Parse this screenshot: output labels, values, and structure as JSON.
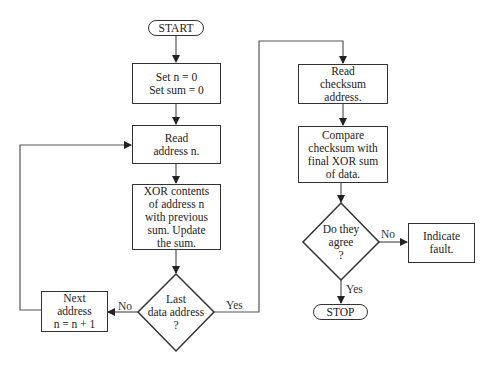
{
  "flowchart": {
    "start": "START",
    "stop": "STOP",
    "init": [
      "Set n = 0",
      "Set sum = 0"
    ],
    "read_address": [
      "Read",
      "address n."
    ],
    "xor_step": [
      "XOR contents",
      "of address n",
      "with previous",
      "sum.  Update",
      "the sum."
    ],
    "decision_last": [
      "Last",
      "data address",
      "?"
    ],
    "next_address": [
      "Next",
      "address",
      "n = n + 1"
    ],
    "read_checksum": [
      "Read",
      "checksum",
      "address."
    ],
    "compare": [
      "Compare",
      "checksum with",
      "final XOR sum",
      "of data."
    ],
    "decision_agree": [
      "Do they",
      "agree",
      "?"
    ],
    "indicate_fault": [
      "Indicate",
      "fault."
    ],
    "edge_labels": {
      "last_no": "No",
      "last_yes": "Yes",
      "agree_no": "No",
      "agree_yes": "Yes"
    }
  },
  "colors": {
    "stroke": "#333333",
    "text": "#222222",
    "background": "#ffffff"
  }
}
